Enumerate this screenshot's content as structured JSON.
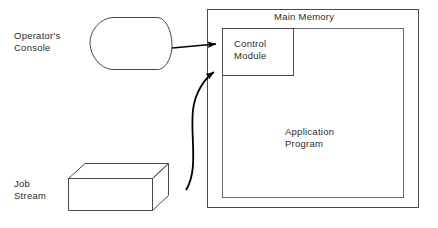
{
  "diagram": {
    "labels": {
      "operator_console": "Operator's\nConsole",
      "job_stream": "Job\nStream",
      "main_memory": "Main Memory",
      "control_module": "Control\nModule",
      "application_program": "Application\nProgram"
    },
    "nodes": [
      {
        "id": "operator-console",
        "name": "operator-console-shape",
        "shape": "display",
        "label": "Operator's Console",
        "x": 90,
        "y": 17,
        "width": 82,
        "height": 53
      },
      {
        "id": "job-stream",
        "name": "job-stream-shape",
        "shape": "cuboid",
        "label": "Job Stream",
        "x": 68,
        "y": 163,
        "width": 100,
        "height": 48
      },
      {
        "id": "main-memory-outer",
        "name": "main-memory-outer-box",
        "shape": "rectangle",
        "label": "Main Memory",
        "x": 207,
        "y": 9,
        "width": 212,
        "height": 199
      },
      {
        "id": "main-memory-inner",
        "name": "main-memory-inner-box",
        "shape": "rectangle",
        "label": "",
        "x": 222,
        "y": 28,
        "width": 182,
        "height": 170
      },
      {
        "id": "control-module",
        "name": "control-module-box",
        "shape": "rectangle",
        "label": "Control Module",
        "x": 222,
        "y": 28,
        "width": 72,
        "height": 48
      }
    ],
    "connectors": [
      {
        "id": "console-to-control",
        "name": "console-to-control-arrow",
        "from": "operator-console",
        "to": "control-module",
        "style": "straight",
        "arrowhead": "end"
      },
      {
        "id": "job-to-control",
        "name": "job-stream-to-control-arrow",
        "from": "job-stream",
        "to": "control-module",
        "style": "curved",
        "arrowhead": "end"
      }
    ],
    "colors": {
      "stroke": "#3a3a3a",
      "arrow": "#000000",
      "text": "#2b2b2b",
      "background": "#ffffff"
    }
  }
}
